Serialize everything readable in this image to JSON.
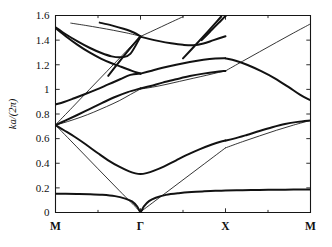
{
  "figure": {
    "name": "phononic-band-structure",
    "background_color": "#ffffff",
    "line_color": "#121212"
  },
  "axes": {
    "y_title": "ka/(2π)",
    "y_ticks": [
      "0",
      "0.2",
      "0.4",
      "0.6",
      "0.8",
      "1",
      "1.2",
      "1.4",
      "1.6"
    ],
    "y_tick_values": [
      0,
      0.2,
      0.4,
      0.6,
      0.8,
      1.0,
      1.2,
      1.4,
      1.6
    ],
    "x_ticks": [
      "M",
      "Γ",
      "X",
      "M"
    ],
    "x_tick_positions": [
      0,
      1,
      2,
      3
    ],
    "x_title": ""
  },
  "chart_data": {
    "type": "line",
    "title": "",
    "subtitle": "",
    "xlabel": "",
    "ylabel": "ka/(2π)",
    "xlim": [
      0,
      3
    ],
    "ylim": [
      0,
      1.6
    ],
    "grid": false,
    "legend": null,
    "x_tick_labels": [
      "M",
      "Γ",
      "X",
      "M"
    ],
    "x_tick_values": [
      0,
      1,
      2,
      3
    ],
    "y_tick_values": [
      0,
      0.2,
      0.4,
      0.6,
      0.8,
      1.0,
      1.2,
      1.4,
      1.6
    ],
    "series": [
      {
        "name": "band-1-acoustic-lower",
        "width": "thick",
        "x": [
          0,
          0.12,
          0.25,
          0.4,
          0.55,
          0.7,
          0.82,
          0.9,
          0.96,
          1.0,
          1.04,
          1.1,
          1.18,
          1.3,
          1.45,
          1.6,
          1.75,
          1.88,
          2.0,
          2.2,
          2.4,
          2.6,
          2.8,
          3.0
        ],
        "y": [
          0.152,
          0.152,
          0.151,
          0.149,
          0.144,
          0.133,
          0.113,
          0.09,
          0.05,
          0.005,
          0.05,
          0.092,
          0.12,
          0.143,
          0.157,
          0.166,
          0.172,
          0.176,
          0.178,
          0.181,
          0.183,
          0.185,
          0.186,
          0.187
        ]
      },
      {
        "name": "band-2-acoustic-upper",
        "width": "thick",
        "x": [
          0,
          0.1,
          0.22,
          0.35,
          0.5,
          0.62,
          0.75,
          0.86,
          0.94,
          1.0,
          1.07,
          1.16,
          1.28,
          1.42,
          1.56,
          1.7,
          1.84,
          1.94,
          2.0
        ],
        "y": [
          0.71,
          0.668,
          0.617,
          0.556,
          0.481,
          0.424,
          0.372,
          0.336,
          0.318,
          0.312,
          0.32,
          0.34,
          0.375,
          0.424,
          0.472,
          0.515,
          0.552,
          0.575,
          0.585
        ]
      },
      {
        "name": "band-2b-X-to-M",
        "width": "thick",
        "x": [
          2.0,
          2.1,
          2.25,
          2.4,
          2.55,
          2.7,
          2.85,
          3.0
        ],
        "y": [
          0.585,
          0.6,
          0.63,
          0.662,
          0.692,
          0.718,
          0.736,
          0.748
        ]
      },
      {
        "name": "band-3-straight-M-to-Gamma",
        "width": "thin",
        "x": [
          0,
          0.25,
          0.5,
          0.75,
          1.0
        ],
        "y": [
          0.71,
          0.533,
          0.355,
          0.178,
          0.005
        ]
      },
      {
        "name": "band-3b-straight-Gamma-to-X",
        "width": "thin",
        "x": [
          1.0,
          1.25,
          1.5,
          1.75,
          2.0
        ],
        "y": [
          0.005,
          0.135,
          0.265,
          0.395,
          0.525
        ]
      },
      {
        "name": "band-3c-X-to-M-upper",
        "width": "thin",
        "x": [
          2.0,
          2.2,
          2.4,
          2.6,
          2.8,
          3.0
        ],
        "y": [
          0.525,
          0.575,
          0.622,
          0.668,
          0.71,
          0.748
        ]
      },
      {
        "name": "band-4-M-up-to-Gamma-one",
        "width": "thick",
        "x": [
          0,
          0.12,
          0.25,
          0.4,
          0.55,
          0.7,
          0.85,
          1.0
        ],
        "y": [
          0.71,
          0.748,
          0.79,
          0.84,
          0.89,
          0.938,
          0.978,
          1.008
        ]
      },
      {
        "name": "band-5-M-flat-rise",
        "width": "thin",
        "x": [
          0,
          0.14,
          0.3,
          0.45,
          0.6,
          0.75,
          0.88,
          1.0
        ],
        "y": [
          0.71,
          0.738,
          0.775,
          0.815,
          0.86,
          0.908,
          0.958,
          1.003
        ]
      },
      {
        "name": "band-6-left-0p88-rise",
        "width": "thick",
        "x": [
          0,
          0.1,
          0.22,
          0.35,
          0.48,
          0.62,
          0.76,
          0.88,
          1.0
        ],
        "y": [
          0.878,
          0.898,
          0.928,
          0.962,
          0.998,
          1.04,
          1.082,
          1.118,
          1.128
        ]
      },
      {
        "name": "band-6b-Gamma-to-X-descend",
        "width": "thick",
        "x": [
          1.0,
          1.12,
          1.26,
          1.42,
          1.58,
          1.74,
          1.88,
          2.0
        ],
        "y": [
          1.128,
          1.15,
          1.175,
          1.2,
          1.222,
          1.24,
          1.25,
          1.252
        ]
      },
      {
        "name": "band-7-Gamma-1p0-to-X-rise",
        "width": "thick",
        "x": [
          1.0,
          1.12,
          1.26,
          1.42,
          1.58,
          1.74,
          1.88,
          2.0
        ],
        "y": [
          1.008,
          1.028,
          1.055,
          1.082,
          1.108,
          1.128,
          1.142,
          1.15
        ]
      },
      {
        "name": "band-7b-Gamma-1p0-secondary",
        "width": "thin",
        "x": [
          1.0,
          1.14,
          1.3,
          1.46,
          1.62,
          1.78,
          1.92,
          2.0
        ],
        "y": [
          1.003,
          1.018,
          1.04,
          1.065,
          1.09,
          1.115,
          1.138,
          1.15
        ]
      },
      {
        "name": "band-8-X-to-M-descend",
        "width": "thick",
        "x": [
          2.0,
          2.12,
          2.26,
          2.42,
          2.58,
          2.74,
          2.88,
          3.0
        ],
        "y": [
          1.252,
          1.232,
          1.198,
          1.148,
          1.09,
          1.02,
          0.955,
          0.912
        ]
      },
      {
        "name": "band-9-X-to-M-straight-up",
        "width": "thin",
        "x": [
          2.0,
          2.2,
          2.4,
          2.6,
          2.8,
          3.0
        ],
        "y": [
          1.15,
          1.228,
          1.305,
          1.382,
          1.458,
          1.532
        ]
      },
      {
        "name": "band-10-M-1p50-descend-to-Gamma",
        "width": "thick",
        "x": [
          0,
          0.12,
          0.26,
          0.4,
          0.54,
          0.66,
          0.78,
          0.88,
          1.0
        ],
        "y": [
          1.505,
          1.448,
          1.39,
          1.338,
          1.295,
          1.268,
          1.262,
          1.288,
          1.428
        ]
      },
      {
        "name": "band-11-M-1p50-to-1p20",
        "width": "thick",
        "x": [
          0,
          0.12,
          0.26,
          0.4,
          0.54,
          0.66,
          0.78,
          0.9,
          1.0
        ],
        "y": [
          1.498,
          1.432,
          1.362,
          1.3,
          1.248,
          1.212,
          1.182,
          1.15,
          1.128
        ]
      },
      {
        "name": "band-12-straight-up-M-to-Gamma",
        "width": "thin",
        "x": [
          0,
          0.2,
          0.4,
          0.6,
          0.8,
          1.0
        ],
        "y": [
          0.712,
          0.855,
          1.0,
          1.143,
          1.287,
          1.43
        ]
      },
      {
        "name": "band-13-top-flat-left",
        "width": "thin",
        "x": [
          0.18,
          0.35,
          0.52,
          0.68,
          0.84,
          1.0
        ],
        "y": [
          1.538,
          1.52,
          1.5,
          1.48,
          1.458,
          1.432
        ]
      },
      {
        "name": "band-14-top-short-segment",
        "width": "thick",
        "x": [
          0.52,
          0.66,
          0.8,
          0.92,
          1.0
        ],
        "y": [
          1.542,
          1.52,
          1.492,
          1.462,
          1.43
        ]
      },
      {
        "name": "band-15-Gamma-1p43-to-X-dip",
        "width": "thick",
        "x": [
          1.0,
          1.1,
          1.22,
          1.36,
          1.5,
          1.62,
          1.74,
          1.86,
          2.0
        ],
        "y": [
          1.428,
          1.41,
          1.392,
          1.375,
          1.362,
          1.358,
          1.372,
          1.4,
          1.432
        ]
      },
      {
        "name": "band-16-Gamma-1p43-rise-out",
        "width": "thin",
        "x": [
          1.0,
          1.12,
          1.25,
          1.38,
          1.5
        ],
        "y": [
          1.43,
          1.468,
          1.51,
          1.552,
          1.59
        ]
      },
      {
        "name": "band-17-X-1p25-to-top-right",
        "width": "thick",
        "x": [
          1.72,
          1.82,
          1.92,
          2.02,
          2.12,
          2.22
        ],
        "y": [
          1.4,
          1.47,
          1.54,
          1.608,
          1.66,
          1.7
        ]
      },
      {
        "name": "band-18-near-X-steep-up",
        "width": "thick",
        "x": [
          1.5,
          1.62,
          1.74,
          1.86,
          1.95
        ],
        "y": [
          1.252,
          1.34,
          1.43,
          1.522,
          1.592
        ]
      },
      {
        "name": "band-19-top-left-steep-from-Gamma",
        "width": "thick",
        "x": [
          0.62,
          0.74,
          0.86,
          0.96,
          1.0
        ],
        "y": [
          1.11,
          1.215,
          1.318,
          1.4,
          1.43
        ]
      }
    ]
  }
}
